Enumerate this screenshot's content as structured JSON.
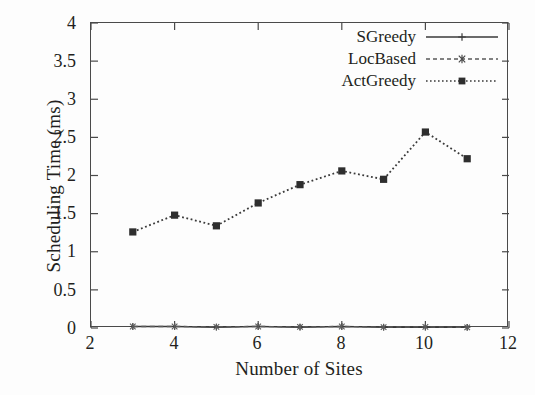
{
  "chart_data": {
    "type": "line",
    "title": "",
    "xlabel": "Number of Sites",
    "ylabel": "Scheduling Time (ms)",
    "xlim": [
      2,
      12
    ],
    "ylim": [
      0,
      4
    ],
    "xticks": [
      "2",
      "4",
      "6",
      "8",
      "10",
      "12"
    ],
    "xtick_values": [
      2,
      4,
      6,
      8,
      10,
      12
    ],
    "yticks": [
      "0",
      "0.5",
      "1",
      "1.5",
      "2",
      "2.5",
      "3",
      "3.5",
      "4"
    ],
    "ytick_values": [
      0,
      0.5,
      1,
      1.5,
      2,
      2.5,
      3,
      3.5,
      4
    ],
    "grid": false,
    "legend_position": "top-right",
    "x": [
      3,
      4,
      5,
      6,
      7,
      8,
      9,
      10,
      11
    ],
    "series": [
      {
        "name": "SGreedy",
        "values": [
          0.02,
          0.02,
          0.01,
          0.02,
          0.01,
          0.02,
          0.01,
          0.01,
          0.01
        ],
        "color": "#3a3a3a",
        "dash": "none",
        "marker": "plus"
      },
      {
        "name": "LocBased",
        "values": [
          0.02,
          0.02,
          0.015,
          0.02,
          0.015,
          0.02,
          0.012,
          0.015,
          0.008
        ],
        "color": "#5a5a5a",
        "dash": "dashed",
        "marker": "star"
      },
      {
        "name": "ActGreedy",
        "values": [
          1.26,
          1.48,
          1.34,
          1.64,
          1.88,
          2.06,
          1.95,
          2.57,
          2.22
        ],
        "color": "#3a3a3a",
        "dash": "dotted",
        "marker": "square"
      }
    ]
  },
  "legend": {
    "items": [
      {
        "label": "SGreedy"
      },
      {
        "label": "LocBased"
      },
      {
        "label": "ActGreedy"
      }
    ]
  },
  "axes": {
    "x_title": "Number of Sites",
    "y_title": "Scheduling Time (ms)"
  }
}
